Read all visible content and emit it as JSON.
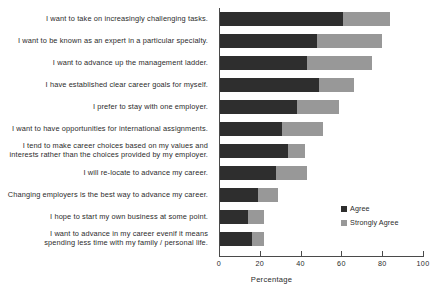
{
  "chart_data": {
    "type": "bar",
    "orientation": "horizontal",
    "stacked": true,
    "title": "",
    "xlabel": "Percentage",
    "ylabel": "",
    "xlim": [
      0,
      100
    ],
    "grid": false,
    "legend_position": "right-inside",
    "categories": [
      "I want to take on increasingly challenging tasks.",
      "I want to be known as an expert in a particular specialty.",
      "I want to advance up the management ladder.",
      "I have established clear career goals for myself.",
      "I prefer to stay with one employer.",
      "I want to have opportunities for international assignments.",
      "I tend to make career choices based on my values and\ninterests rather than the choices provided by my employer.",
      "I will re-locate to advance my career.",
      "Changing employers is the best way to advance my career.",
      "I hope to start my own business at some point.",
      "I want to advance in my career evenif it means\nspending less time with my family / personal life."
    ],
    "series": [
      {
        "name": "Agree",
        "color": "#2e2e2e",
        "values": [
          61,
          48,
          43,
          49,
          38,
          31,
          34,
          28,
          19,
          14,
          16
        ]
      },
      {
        "name": "Strongly Agree",
        "color": "#989898",
        "values": [
          23,
          32,
          32,
          17,
          21,
          20,
          8,
          15,
          10,
          8,
          6
        ]
      }
    ],
    "xticks": [
      0,
      20,
      40,
      60,
      80,
      100
    ],
    "xtick_labels": [
      "0",
      "20",
      "40",
      "60",
      "80",
      "100"
    ]
  },
  "legend": {
    "items": [
      {
        "label": "Agree",
        "color": "#2e2e2e"
      },
      {
        "label": "Strongly Agree",
        "color": "#989898"
      }
    ]
  },
  "axis": {
    "x_title": "Percentage"
  }
}
